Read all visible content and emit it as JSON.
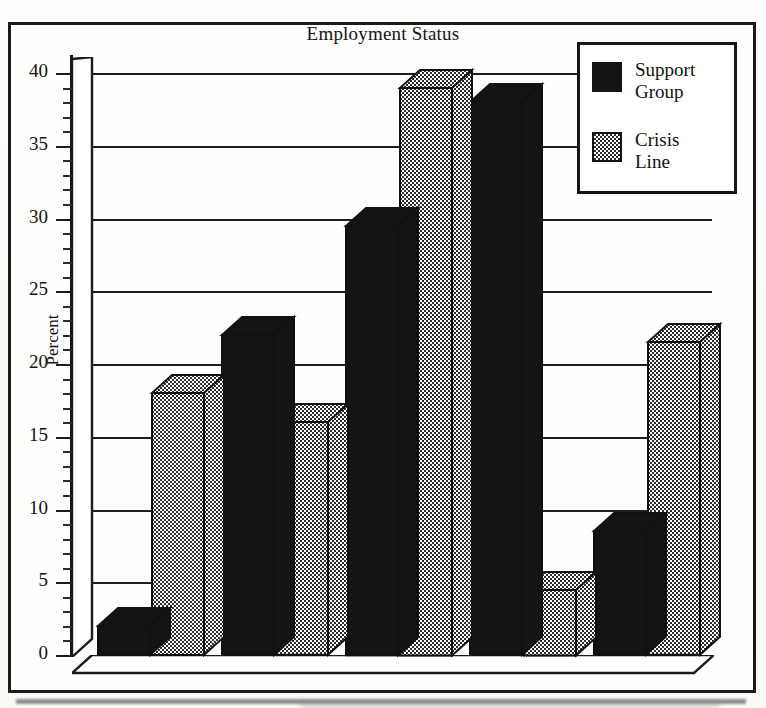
{
  "figure": {
    "title": "Employment Status",
    "frame_color": "#1a1a1a",
    "background": "#fefefd"
  },
  "legend": {
    "position": "top-right",
    "entries": [
      {
        "label_line1": "Support",
        "label_line2": "Group",
        "swatch": "black",
        "color": "#141414"
      },
      {
        "label_line1": "Crisis",
        "label_line2": "Line",
        "swatch": "gray-dither",
        "color": "#8e8e8e"
      }
    ]
  },
  "axes": {
    "ylabel": "Percent",
    "yticks": [
      "0",
      "5",
      "10",
      "15",
      "20",
      "25",
      "30",
      "35",
      "40"
    ],
    "ymin": 0,
    "ymax": 40,
    "ystep": 5,
    "minor_step": 1,
    "xlabel": "",
    "xticks": [
      "Unemployed",
      "Full time",
      "Part time",
      "Homemaker",
      "Student"
    ]
  },
  "chart_data": {
    "type": "bar",
    "title": "Employment Status",
    "xlabel": "",
    "ylabel": "Percent",
    "ylim": [
      0,
      40
    ],
    "ytick_step": 5,
    "grid": true,
    "legend_position": "top-right",
    "style": "3d-clustered-bar",
    "categories": [
      "Unemployed",
      "Full time",
      "Part time",
      "Homemaker",
      "Student"
    ],
    "series": [
      {
        "name": "Support Group",
        "color": "#141414",
        "values": [
          2,
          22,
          29.5,
          38,
          8.5
        ]
      },
      {
        "name": "Crisis Line",
        "color": "#8e8e8e",
        "values": [
          18,
          16,
          39,
          4.5,
          21.5
        ]
      }
    ]
  }
}
